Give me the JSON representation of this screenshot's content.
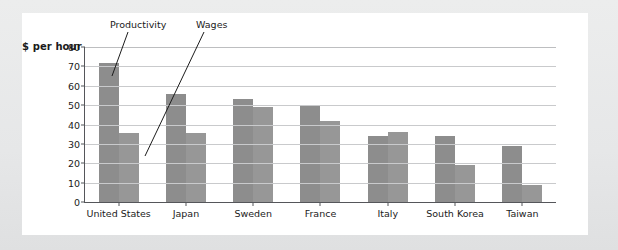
{
  "axis_title": "$ per hour",
  "annotations": {
    "productivity": "Productivity",
    "wages": "Wages"
  },
  "ticks": {
    "y": [
      "80",
      "70",
      "60",
      "50",
      "40",
      "30",
      "20",
      "10",
      "0"
    ]
  },
  "colors": {
    "bar_productivity": "#8d8d8d",
    "bar_wages": "#979797",
    "axis": "#55565a",
    "grid": "#c9cacc",
    "panel": "#ffffff",
    "page": "#e8e9ea"
  },
  "chart_data": {
    "type": "bar",
    "title": "",
    "xlabel": "",
    "ylabel": "$ per hour",
    "ylim": [
      0,
      80
    ],
    "yticks": [
      0,
      10,
      20,
      30,
      40,
      50,
      60,
      70,
      80
    ],
    "grid": true,
    "legend": "none (series labeled by leader-line annotations)",
    "categories": [
      "United States",
      "Japan",
      "Sweden",
      "France",
      "Italy",
      "South Korea",
      "Taiwan"
    ],
    "series": [
      {
        "name": "Productivity",
        "values": [
          72,
          56,
          53,
          50,
          34,
          34,
          29
        ]
      },
      {
        "name": "Wages",
        "values": [
          35.5,
          35.5,
          49,
          42,
          36,
          19,
          9
        ]
      }
    ]
  }
}
